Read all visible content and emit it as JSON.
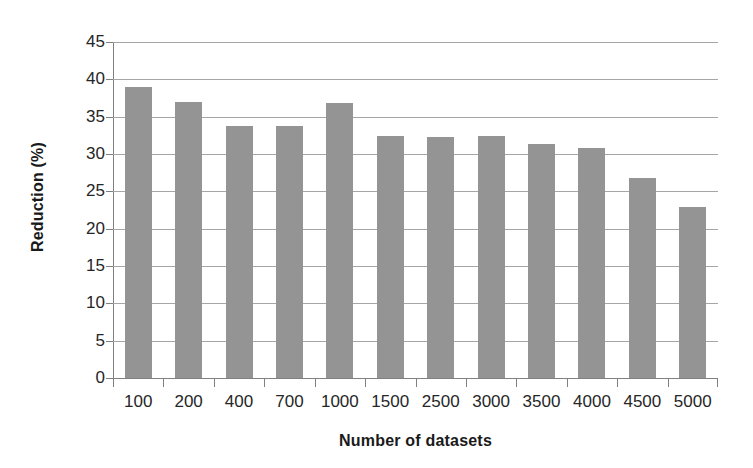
{
  "chart_data": {
    "type": "bar",
    "title": "",
    "xlabel": "Number of datasets",
    "ylabel": "Reduction (%)",
    "categories": [
      "100",
      "200",
      "400",
      "700",
      "1000",
      "1500",
      "2500",
      "3000",
      "3500",
      "4000",
      "4500",
      "5000"
    ],
    "values": [
      39.0,
      36.9,
      33.8,
      33.7,
      36.8,
      32.4,
      32.3,
      32.4,
      31.3,
      30.8,
      26.8,
      22.9
    ],
    "ylim": [
      0,
      45
    ],
    "ytick_labels": [
      "45",
      "40",
      "35",
      "30",
      "25",
      "20",
      "15",
      "10",
      "5",
      "0"
    ],
    "ytick_values": [
      45,
      40,
      35,
      30,
      25,
      20,
      15,
      10,
      5,
      0
    ],
    "grid": "horizontal",
    "legend": "none",
    "bar_color": "#949494",
    "gridline_color": "#a6a6a6",
    "axis_color": "#808080",
    "text_color": "#262626",
    "background_color": "#ffffff"
  }
}
